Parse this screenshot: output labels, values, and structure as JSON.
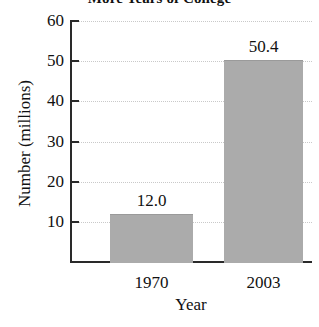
{
  "chart_data": {
    "type": "bar",
    "title": "More Years of College",
    "xlabel": "Year",
    "ylabel": "Number (millions)",
    "categories": [
      "1970",
      "2003"
    ],
    "values": [
      12.0,
      50.4
    ],
    "data_labels": [
      "12.0",
      "50.4"
    ],
    "ylim": [
      0,
      60
    ],
    "ytick_labels": [
      "10",
      "20",
      "30",
      "40",
      "50",
      "60"
    ],
    "ytick_values": [
      10,
      20,
      30,
      40,
      50,
      60
    ],
    "grid": true,
    "legend": "none",
    "bar_color": "#ababab",
    "axis_color": "#2a2a2a",
    "grid_color": "#c9c9c9"
  }
}
